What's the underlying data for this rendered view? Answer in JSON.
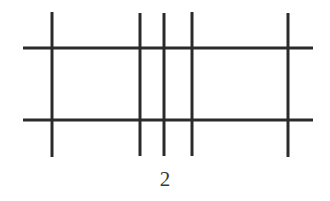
{
  "figure": {
    "caption": "2",
    "background_color": "#ffffff",
    "line_color": "#2b2b2d",
    "canvas": {
      "width": 330,
      "height": 201
    },
    "chart_data": {
      "type": "line",
      "title": "",
      "xlabel": "",
      "ylabel": "",
      "description": "Line drawing of a grid: five vertical strokes crossed by two horizontal strokes, captioned 2",
      "grid": true,
      "legend": "none",
      "xlim": [
        0,
        330
      ],
      "ylim": [
        0,
        201
      ],
      "vertical_lines": [
        {
          "name": "vertical-1",
          "x": 52,
          "y_top": 12,
          "y_bottom": 157,
          "width": 3
        },
        {
          "name": "vertical-2",
          "x": 140,
          "y_top": 13,
          "y_bottom": 156,
          "width": 3
        },
        {
          "name": "vertical-3",
          "x": 164,
          "y_top": 13,
          "y_bottom": 156,
          "width": 3
        },
        {
          "name": "vertical-4",
          "x": 192,
          "y_top": 12,
          "y_bottom": 156,
          "width": 3
        },
        {
          "name": "vertical-5",
          "x": 288,
          "y_top": 13,
          "y_bottom": 157,
          "width": 3
        }
      ],
      "horizontal_lines": [
        {
          "name": "horizontal-1",
          "y": 48,
          "x_left": 23,
          "x_right": 313,
          "width": 3
        },
        {
          "name": "horizontal-2",
          "y": 120,
          "x_left": 23,
          "x_right": 313,
          "width": 3
        }
      ],
      "counts": {
        "vertical": 5,
        "horizontal": 2,
        "intersections": 10
      }
    }
  }
}
